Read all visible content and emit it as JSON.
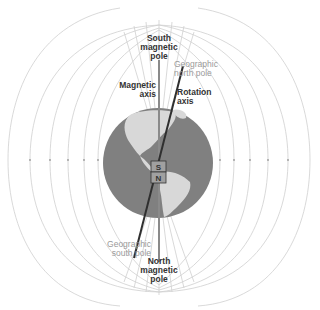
{
  "diagram": {
    "labels": {
      "south_magnetic_pole": "South\nmagnetic\npole",
      "geographic_north_pole": "Geographic\nnorth pole",
      "magnetic_axis": "Magnetic\naxis",
      "rotation_axis": "Rotation\naxis",
      "geographic_south_pole": "Geographic\nsouth pole",
      "north_magnetic_pole": "North\nmagnetic\npole"
    },
    "magnet": {
      "top": "S",
      "bottom": "N"
    },
    "colors": {
      "globe_ocean": "#808080",
      "land": "#d9d9d9",
      "field_lines": "#c8c8c8",
      "axis_line": "#333333",
      "magnet_fill": "#9e9e9e"
    }
  }
}
